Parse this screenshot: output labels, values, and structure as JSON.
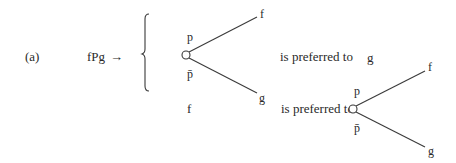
{
  "figure": {
    "label": "(a)",
    "premise": "fPg",
    "arrow": "→",
    "tree1": {
      "upper_branch_label": "p",
      "lower_branch_label": "p̄",
      "upper_outcome": "f",
      "lower_outcome": "g"
    },
    "relation1": "is preferred to",
    "rhs1": "g",
    "lhs2": "f",
    "relation2": "is preferred to",
    "tree2": {
      "upper_branch_label": "p",
      "lower_branch_label": "p̄",
      "upper_outcome": "f",
      "lower_outcome": "g"
    }
  }
}
